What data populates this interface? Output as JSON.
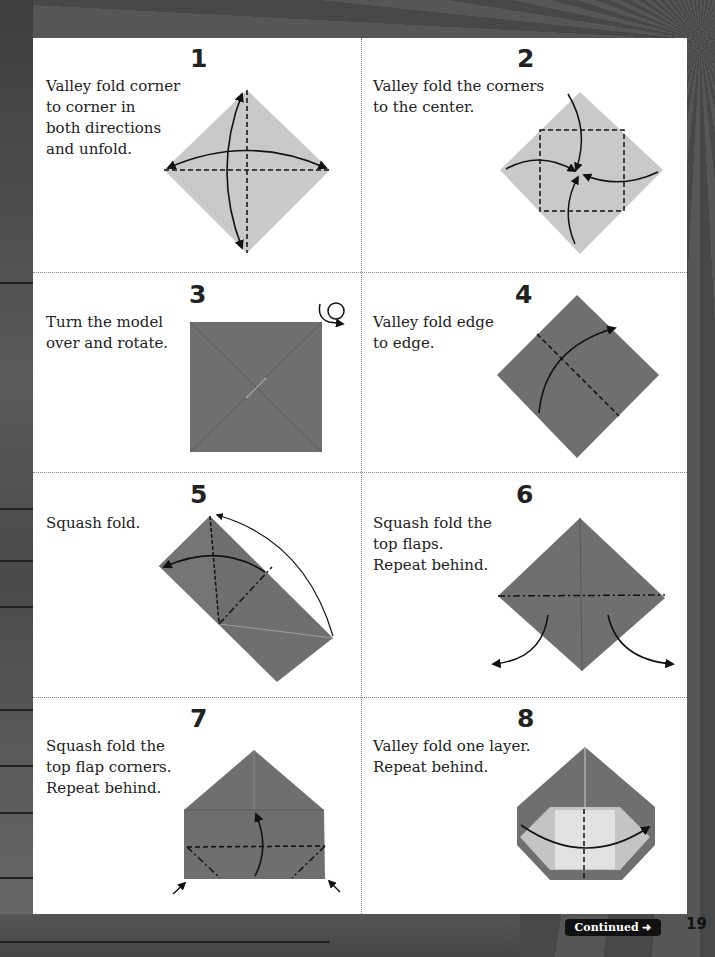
{
  "page": {
    "page_number": "19",
    "continued_label": "Continued",
    "continued_icon": "arrow-right-icon"
  },
  "colors": {
    "paper_light": "#c9c9c9",
    "paper_dark": "#6f6f6f",
    "paper_inner": "#e2e2e2",
    "line": "#111111"
  },
  "steps": [
    {
      "number": "1",
      "text": "Valley fold corner\nto corner in\nboth directions\nand unfold."
    },
    {
      "number": "2",
      "text": "Valley fold the corners\nto the center."
    },
    {
      "number": "3",
      "text": "Turn the model\nover and rotate."
    },
    {
      "number": "4",
      "text": "Valley fold edge\nto edge."
    },
    {
      "number": "5",
      "text": "Squash fold."
    },
    {
      "number": "6",
      "text": "Squash fold the\ntop flaps.\nRepeat behind."
    },
    {
      "number": "7",
      "text": "Squash fold the\ntop flap corners.\nRepeat behind."
    },
    {
      "number": "8",
      "text": "Valley fold one layer.\nRepeat behind."
    }
  ]
}
